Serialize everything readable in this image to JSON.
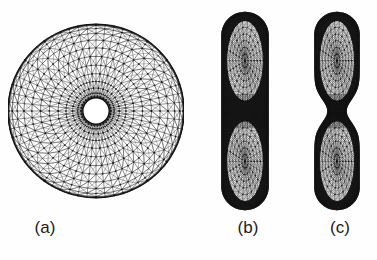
{
  "figure": {
    "type": "triangulated-torus-mesh-views",
    "background_color": "#fefefe",
    "line_color": "#141414",
    "panel_count": 3
  },
  "panels": [
    {
      "id": "a",
      "label": "(a)",
      "view": "top",
      "description": "top view of triangulated torus annulus",
      "outer_radius": 88,
      "inner_radius": 14,
      "radial_rings": 13,
      "angular_segments": 60
    },
    {
      "id": "b",
      "label": "(b)",
      "view": "side",
      "description": "side view of triangulated torus, wide waist",
      "half_width": 23,
      "height": 197,
      "waist_half_width": 23,
      "radial_rings": 13,
      "angular_segments": 60
    },
    {
      "id": "c",
      "label": "(c)",
      "view": "side-rotated",
      "description": "side view of triangulated torus, pinched waist",
      "half_width": 22,
      "height": 197,
      "waist_half_width": 9,
      "radial_rings": 13,
      "angular_segments": 60
    }
  ],
  "labels": {
    "a": "(a)",
    "b": "(b)",
    "c": "(c)"
  }
}
